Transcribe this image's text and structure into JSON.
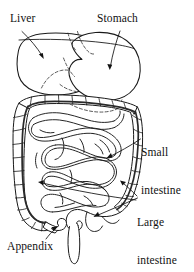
{
  "figure": {
    "style": "black-and-white line drawing",
    "background_color": "#ffffff",
    "ink_color": "#111111",
    "width": 194,
    "height": 272
  },
  "labels": {
    "liver": {
      "text": "Liver",
      "position": "top-left"
    },
    "stomach": {
      "text": "Stomach",
      "position": "top-right"
    },
    "small_intestine": {
      "line1": "Small",
      "line2": "intestine",
      "position": "middle-right"
    },
    "large_intestine": {
      "line1": "Large",
      "line2": "intestine",
      "position": "lower-right"
    },
    "appendix": {
      "text": "Appendix",
      "position": "bottom-left"
    }
  },
  "organs": [
    {
      "name": "liver",
      "label": "Liver",
      "rendering": "solid outline, upper-left lobe mass"
    },
    {
      "name": "stomach",
      "label": "Stomach",
      "rendering": "solid outline with dashed hidden contour, upper-right"
    },
    {
      "name": "small-intestine",
      "label": "Small intestine",
      "rendering": "coiled loops filling the central cavity"
    },
    {
      "name": "large-intestine",
      "label": "Large intestine",
      "rendering": "haustrated frame: ascending, transverse, descending, sigmoid colon"
    },
    {
      "name": "appendix",
      "label": "Appendix",
      "rendering": "small hook at lower-left of cecum"
    },
    {
      "name": "rectum",
      "label": "",
      "rendering": "vertical tube at bottom center"
    }
  ],
  "leaders": [
    {
      "from": "liver",
      "direction": "down-right into liver body"
    },
    {
      "from": "stomach",
      "direction": "down-left into stomach body"
    },
    {
      "from": "small-intestine",
      "direction": "left into central coils"
    },
    {
      "from": "large-intestine",
      "direction": "two lines left to descending colon and sigmoid colon"
    },
    {
      "from": "appendix",
      "direction": "up-right to appendix hook"
    }
  ]
}
